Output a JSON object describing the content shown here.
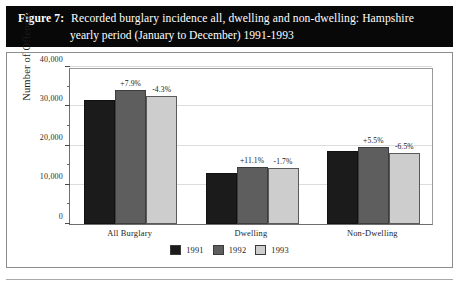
{
  "figure": {
    "number_label": "Figure 7:",
    "title_line1": "Recorded burglary incidence all, dwelling and non-dwelling: Hampshire",
    "title_line2": "yearly period (January to December) 1991-1993"
  },
  "colors": {
    "banner_background": "#080808",
    "banner_text": "#ffffff",
    "series_1991": "#1b1b1b",
    "series_1992": "#5e5e5e",
    "series_1993": "#cdcdcd",
    "frame_border": "#8d8d8d",
    "gridline": "#dcdcdc"
  },
  "chart_data": {
    "type": "bar",
    "title": "Recorded burglary incidence all, dwelling and non-dwelling: Hampshire yearly period (January to December) 1991-1993",
    "xlabel": "",
    "ylabel": "Number of Offences",
    "ylim": [
      0,
      40000
    ],
    "ytick_labels": [
      "0",
      "10,000",
      "20,000",
      "30,000",
      "40,000"
    ],
    "ytick_values": [
      0,
      10000,
      20000,
      30000,
      40000
    ],
    "yminor_values": [
      5000,
      15000,
      25000,
      35000
    ],
    "grid": true,
    "legend_position": "bottom-center",
    "categories": [
      "All Burglary",
      "Dwelling",
      "Non-Dwelling"
    ],
    "series": [
      {
        "name": "1991",
        "color": "#1b1b1b",
        "values": [
          31700,
          13000,
          18500
        ],
        "annotations": [
          "",
          "",
          ""
        ]
      },
      {
        "name": "1992",
        "color": "#5e5e5e",
        "values": [
          34200,
          14400,
          19500
        ],
        "annotations": [
          "+7.9%",
          "+11.1%",
          "+5.5%"
        ]
      },
      {
        "name": "1993",
        "color": "#cdcdcd",
        "values": [
          32700,
          14200,
          18200
        ],
        "annotations": [
          "-4.3%",
          "-1.7%",
          "-6.5%"
        ]
      }
    ]
  }
}
